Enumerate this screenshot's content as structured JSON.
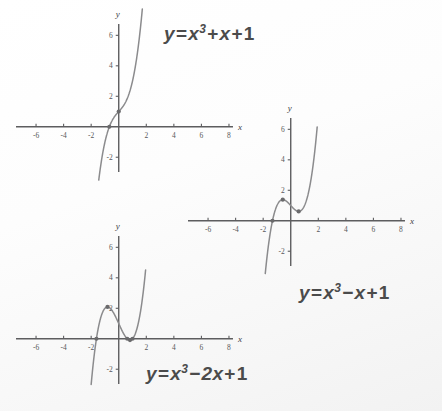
{
  "page": {
    "background": "#fbfbfb",
    "curve_color": "#8b8b8d",
    "axis_color": "#5d5d5f",
    "text_color": "#4b4b4b"
  },
  "chart_data": [
    {
      "id": "plot-1",
      "type": "line",
      "title": "y = x^3 + x + 1",
      "equation_parts": {
        "lhs": "y",
        "eq": "=",
        "base": "x",
        "exponent": "3",
        "op1": "+",
        "term2": "x",
        "op2": "+",
        "term3": "1"
      },
      "xlabel": "x",
      "ylabel": "y",
      "xlim": [
        -7.6,
        8.8
      ],
      "ylim": [
        -3.1,
        7.4
      ],
      "xticks": [
        -6,
        -4,
        -2,
        2,
        4,
        6,
        8
      ],
      "xtick_labels": [
        "-6",
        "-4",
        "-2",
        "2",
        "4",
        "6",
        "8"
      ],
      "yticks": [
        -2,
        2,
        4,
        6
      ],
      "ytick_labels": [
        "-2",
        "2",
        "4",
        "6"
      ],
      "grid": false,
      "marked_points": [
        {
          "x": 0,
          "y": 1,
          "label": "y-intercept"
        },
        {
          "x": -0.682,
          "y": 0,
          "label": "real root"
        }
      ],
      "x_domain_drawn": [
        -1.72,
        1.72
      ],
      "roots": [
        -0.682
      ],
      "critical_points": "none (monotonic increasing)"
    },
    {
      "id": "plot-2",
      "type": "line",
      "title": "y = x^3 - x + 1",
      "equation_parts": {
        "lhs": "y",
        "eq": "=",
        "base": "x",
        "exponent": "3",
        "op1": "−",
        "term2": "x",
        "op2": "+",
        "term3": "1"
      },
      "xlabel": "x",
      "ylabel": "y",
      "xlim": [
        -7.6,
        8.8
      ],
      "ylim": [
        -3.1,
        7.4
      ],
      "xticks": [
        -6,
        -4,
        -2,
        2,
        4,
        6,
        8
      ],
      "xtick_labels": [
        "-6",
        "-4",
        "-2",
        "2",
        "4",
        "6",
        "8"
      ],
      "yticks": [
        -2,
        2,
        4,
        6
      ],
      "ytick_labels": [
        "-2",
        "2",
        "4",
        "6"
      ],
      "grid": false,
      "marked_points": [
        {
          "x": -0.577,
          "y": 1.385,
          "label": "local maximum"
        },
        {
          "x": 0.577,
          "y": 0.615,
          "label": "local minimum"
        },
        {
          "x": -1.325,
          "y": 0,
          "label": "real root"
        }
      ],
      "x_domain_drawn": [
        -1.95,
        1.92
      ],
      "roots": [
        -1.325
      ],
      "critical_points": "local max at x=-0.577, local min at x=0.577"
    },
    {
      "id": "plot-3",
      "type": "line",
      "title": "y = x^3 - 2x + 1",
      "equation_parts": {
        "lhs": "y",
        "eq": "=",
        "base": "x",
        "exponent": "3",
        "op1": "−",
        "term2": "2x",
        "op2": "+",
        "term3": "1"
      },
      "xlabel": "x",
      "ylabel": "y",
      "xlim": [
        -7.6,
        8.8
      ],
      "ylim": [
        -3.1,
        7.4
      ],
      "xticks": [
        -6,
        -4,
        -2,
        2,
        4,
        6,
        8
      ],
      "xtick_labels": [
        "-6",
        "-4",
        "-2",
        "2",
        "4",
        "6",
        "8"
      ],
      "yticks": [
        -2,
        2,
        4,
        6
      ],
      "ytick_labels": [
        "-2",
        "2",
        "4",
        "6"
      ],
      "grid": false,
      "marked_points": [
        {
          "x": -0.816,
          "y": 2.089,
          "label": "local maximum"
        },
        {
          "x": 0.816,
          "y": -0.089,
          "label": "local minimum"
        },
        {
          "x": -1.618,
          "y": 0,
          "label": "real root"
        },
        {
          "x": 0.618,
          "y": 0,
          "label": "real root"
        },
        {
          "x": 1.0,
          "y": 0,
          "label": "real root"
        }
      ],
      "x_domain_drawn": [
        -2.0,
        1.95
      ],
      "roots": [
        -1.618,
        0.618,
        1.0
      ],
      "critical_points": "local max at x=-0.816, local min at x=0.816"
    }
  ]
}
